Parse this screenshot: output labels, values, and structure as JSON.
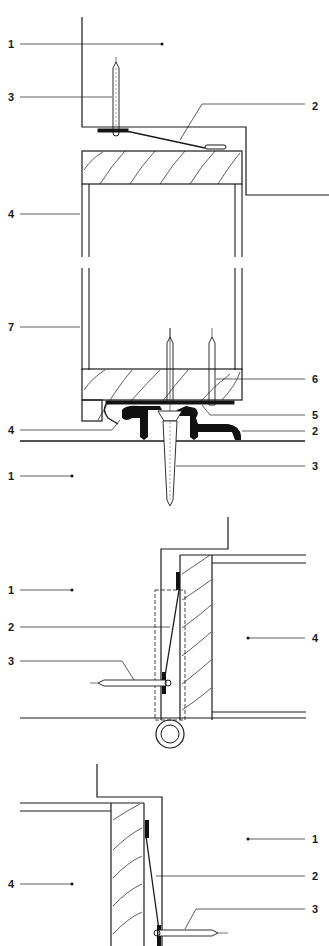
{
  "figures": [
    {
      "id": "door-threshold-section",
      "labels": [
        {
          "num": "1",
          "x": 8,
          "y": 48
        },
        {
          "num": "3",
          "x": 8,
          "y": 101
        },
        {
          "num": "2",
          "x": 312,
          "y": 110
        },
        {
          "num": "4",
          "x": 8,
          "y": 218
        },
        {
          "num": "7",
          "x": 8,
          "y": 331
        },
        {
          "num": "6",
          "x": 312,
          "y": 383
        },
        {
          "num": "5",
          "x": 312,
          "y": 419
        },
        {
          "num": "4",
          "x": 8,
          "y": 434
        },
        {
          "num": "2",
          "x": 312,
          "y": 435
        },
        {
          "num": "3",
          "x": 312,
          "y": 470
        },
        {
          "num": "1",
          "x": 8,
          "y": 480
        }
      ]
    },
    {
      "id": "hinge-side-jamb-section",
      "labels": [
        {
          "num": "1",
          "x": 8,
          "y": 594
        },
        {
          "num": "2",
          "x": 8,
          "y": 631
        },
        {
          "num": "4",
          "x": 312,
          "y": 642
        },
        {
          "num": "3",
          "x": 8,
          "y": 665
        }
      ]
    },
    {
      "id": "lock-side-jamb-section",
      "labels": [
        {
          "num": "1",
          "x": 312,
          "y": 843
        },
        {
          "num": "4",
          "x": 8,
          "y": 888
        },
        {
          "num": "2",
          "x": 312,
          "y": 880
        },
        {
          "num": "3",
          "x": 312,
          "y": 917
        }
      ]
    }
  ],
  "colors": {
    "line": "#1a1a1a",
    "fill": "#111111",
    "paper": "#ffffff"
  }
}
